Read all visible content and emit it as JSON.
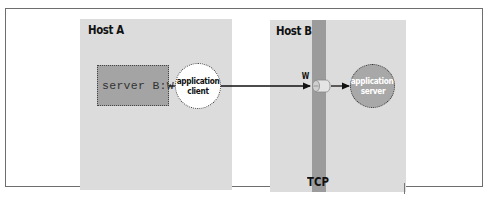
{
  "diagram": {
    "hosts": [
      {
        "id": "host-a",
        "title": "Host A"
      },
      {
        "id": "host-b",
        "title": "Host B"
      }
    ],
    "host_a": {
      "title": "Host A",
      "socket_box": {
        "label": "server B:W"
      },
      "process": {
        "line1": "application",
        "line2": "client"
      }
    },
    "host_b": {
      "title": "Host B",
      "port_label": "W",
      "transport_label": "TCP",
      "process": {
        "line1": "application",
        "line2": "server"
      }
    },
    "connections": [
      {
        "from": "server B:W",
        "to": "application client",
        "type": "line"
      },
      {
        "from": "application client",
        "to": "W",
        "type": "arrow"
      },
      {
        "from": "W",
        "to": "application server",
        "type": "arrow"
      }
    ],
    "colors": {
      "host_background": "#dcdcdc",
      "socket_box": "#a4a4a4",
      "tcp_bar": "#9b9b9b",
      "server_circle": "#a8a8a8",
      "client_circle": "#ffffff",
      "frame_border": "#6e6e6e"
    }
  }
}
